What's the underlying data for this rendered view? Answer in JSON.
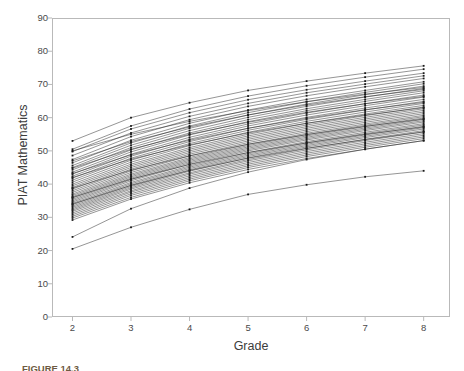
{
  "figure": {
    "caption": "FIGURE 14.3",
    "background_color": "#ffffff",
    "frame_color": "#b9b9b9",
    "line_color": "#1a1a1a",
    "text_color": "#3c3c3c"
  },
  "chart_data": {
    "type": "line",
    "title": "",
    "subtitle": "",
    "xlabel": "Grade",
    "ylabel": "PIAT Mathematics",
    "xlim": [
      1.65,
      8.45
    ],
    "ylim": [
      0,
      90
    ],
    "xticks": [
      2,
      3,
      4,
      5,
      6,
      7,
      8
    ],
    "xtick_labels": [
      "2",
      "3",
      "4",
      "5",
      "6",
      "7",
      "8"
    ],
    "yticks": [
      0,
      10,
      20,
      30,
      40,
      50,
      60,
      70,
      80,
      90
    ],
    "ytick_labels": [
      "0",
      "10",
      "20",
      "30",
      "40",
      "50",
      "60",
      "70",
      "80",
      "90"
    ],
    "grid": false,
    "legend": null,
    "legend_position": "none",
    "marker": "dot",
    "x": [
      2,
      3,
      4,
      5,
      6,
      7,
      8
    ],
    "series": [
      {
        "name": "case-01",
        "values": [
          53.0,
          60.0,
          64.5,
          68.2,
          71.0,
          73.4,
          75.6
        ]
      },
      {
        "name": "case-02",
        "values": [
          50.5,
          57.5,
          62.6,
          66.5,
          69.6,
          72.2,
          74.6
        ]
      },
      {
        "name": "case-03",
        "values": [
          49.8,
          56.6,
          61.5,
          65.4,
          68.4,
          71.0,
          73.4
        ]
      },
      {
        "name": "case-04",
        "values": [
          48.6,
          55.4,
          60.4,
          64.3,
          67.5,
          70.1,
          72.6
        ]
      },
      {
        "name": "case-05",
        "values": [
          47.4,
          54.3,
          59.4,
          63.4,
          66.6,
          69.3,
          71.8
        ]
      },
      {
        "name": "case-06",
        "values": [
          46.4,
          53.2,
          58.3,
          62.3,
          65.5,
          68.2,
          70.8
        ]
      },
      {
        "name": "case-07",
        "values": [
          45.6,
          52.4,
          57.5,
          61.5,
          64.8,
          67.6,
          70.2
        ]
      },
      {
        "name": "case-08",
        "values": [
          45.0,
          51.7,
          56.8,
          60.8,
          64.1,
          66.9,
          69.5
        ]
      },
      {
        "name": "case-09",
        "values": [
          44.3,
          51.0,
          56.1,
          60.1,
          63.4,
          66.2,
          68.8
        ]
      },
      {
        "name": "case-10",
        "values": [
          43.6,
          50.3,
          55.4,
          59.4,
          62.7,
          65.5,
          68.1
        ]
      },
      {
        "name": "case-11",
        "values": [
          43.0,
          49.7,
          54.8,
          58.8,
          62.1,
          64.9,
          67.5
        ]
      },
      {
        "name": "case-12",
        "values": [
          42.4,
          49.0,
          54.1,
          58.1,
          61.4,
          64.2,
          66.8
        ]
      },
      {
        "name": "case-13",
        "values": [
          41.8,
          48.4,
          53.5,
          57.5,
          60.8,
          63.6,
          66.2
        ]
      },
      {
        "name": "case-14",
        "values": [
          41.2,
          47.8,
          52.8,
          56.8,
          60.1,
          62.9,
          65.5
        ]
      },
      {
        "name": "case-15",
        "values": [
          40.6,
          47.2,
          52.2,
          56.2,
          59.5,
          62.3,
          64.9
        ]
      },
      {
        "name": "case-16",
        "values": [
          40.0,
          46.6,
          51.6,
          55.6,
          58.9,
          61.7,
          64.3
        ]
      },
      {
        "name": "case-17",
        "values": [
          39.5,
          46.0,
          51.0,
          55.0,
          58.3,
          61.1,
          63.7
        ]
      },
      {
        "name": "case-18",
        "values": [
          39.0,
          45.5,
          50.5,
          54.5,
          57.8,
          60.6,
          63.2
        ]
      },
      {
        "name": "case-19",
        "values": [
          38.5,
          45.0,
          50.0,
          54.0,
          57.3,
          60.1,
          62.7
        ]
      },
      {
        "name": "case-20",
        "values": [
          38.0,
          44.5,
          49.5,
          53.5,
          56.8,
          59.6,
          62.2
        ]
      },
      {
        "name": "case-21",
        "values": [
          37.5,
          44.0,
          49.0,
          53.0,
          56.3,
          59.1,
          61.7
        ]
      },
      {
        "name": "case-22",
        "values": [
          37.0,
          43.5,
          48.5,
          52.5,
          55.8,
          58.6,
          61.2
        ]
      },
      {
        "name": "case-23",
        "values": [
          36.6,
          43.0,
          48.0,
          52.0,
          55.3,
          58.1,
          60.7
        ]
      },
      {
        "name": "case-24",
        "values": [
          36.2,
          42.6,
          47.6,
          51.6,
          54.9,
          57.7,
          60.3
        ]
      },
      {
        "name": "case-25",
        "values": [
          35.8,
          42.2,
          47.2,
          51.2,
          54.5,
          57.3,
          59.9
        ]
      },
      {
        "name": "case-26",
        "values": [
          35.4,
          41.8,
          46.8,
          50.8,
          54.1,
          56.9,
          59.5
        ]
      },
      {
        "name": "case-27",
        "values": [
          35.0,
          41.4,
          46.4,
          50.4,
          53.7,
          56.5,
          59.1
        ]
      },
      {
        "name": "case-28",
        "values": [
          34.6,
          41.0,
          46.0,
          50.0,
          53.3,
          56.1,
          58.7
        ]
      },
      {
        "name": "case-29",
        "values": [
          34.2,
          40.5,
          45.5,
          49.5,
          52.8,
          55.6,
          58.2
        ]
      },
      {
        "name": "case-30",
        "values": [
          33.8,
          40.1,
          45.1,
          49.1,
          52.4,
          55.2,
          57.8
        ]
      },
      {
        "name": "case-31",
        "values": [
          33.4,
          39.7,
          44.7,
          48.7,
          52.0,
          54.8,
          57.4
        ]
      },
      {
        "name": "case-32",
        "values": [
          33.0,
          39.3,
          44.3,
          48.3,
          51.6,
          54.4,
          57.0
        ]
      },
      {
        "name": "case-33",
        "values": [
          32.6,
          38.9,
          43.9,
          47.9,
          51.2,
          54.0,
          56.6
        ]
      },
      {
        "name": "case-34",
        "values": [
          32.2,
          38.5,
          43.4,
          47.4,
          50.7,
          53.5,
          56.1
        ]
      },
      {
        "name": "case-35",
        "values": [
          31.8,
          38.0,
          43.0,
          47.0,
          50.3,
          53.1,
          55.7
        ]
      },
      {
        "name": "case-36",
        "values": [
          31.3,
          37.6,
          42.5,
          46.5,
          49.8,
          52.6,
          55.2
        ]
      },
      {
        "name": "case-37",
        "values": [
          30.8,
          37.1,
          42.0,
          46.0,
          49.3,
          52.1,
          54.7
        ]
      },
      {
        "name": "case-38",
        "values": [
          30.3,
          36.6,
          41.5,
          45.5,
          48.8,
          51.6,
          54.2
        ]
      },
      {
        "name": "case-39",
        "values": [
          29.8,
          36.0,
          41.0,
          45.0,
          48.3,
          51.1,
          53.7
        ]
      },
      {
        "name": "case-40",
        "values": [
          29.2,
          35.5,
          40.4,
          44.4,
          47.7,
          50.5,
          53.1
        ]
      },
      {
        "name": "case-41",
        "values": [
          42.0,
          47.5,
          51.8,
          55.4,
          58.3,
          60.8,
          63.0
        ]
      },
      {
        "name": "case-42",
        "values": [
          44.8,
          50.5,
          55.0,
          58.6,
          61.6,
          64.2,
          66.4
        ]
      },
      {
        "name": "case-43",
        "values": [
          47.0,
          52.8,
          57.2,
          60.8,
          63.8,
          66.3,
          68.5
        ]
      },
      {
        "name": "case-44",
        "values": [
          38.8,
          44.2,
          48.5,
          52.0,
          54.9,
          57.4,
          59.6
        ]
      },
      {
        "name": "case-45",
        "values": [
          36.0,
          41.5,
          45.9,
          49.5,
          52.4,
          55.0,
          57.2
        ]
      },
      {
        "name": "case-46",
        "values": [
          34.0,
          39.6,
          44.1,
          47.8,
          50.8,
          53.4,
          55.7
        ]
      },
      {
        "name": "case-47",
        "values": [
          50.0,
          55.0,
          58.9,
          62.1,
          64.8,
          67.1,
          69.1
        ]
      },
      {
        "name": "case-48",
        "values": [
          43.2,
          48.8,
          53.2,
          56.8,
          59.8,
          62.4,
          64.6
        ]
      },
      {
        "name": "case-49",
        "values": [
          24.1,
          32.6,
          38.8,
          43.6,
          47.4,
          50.5,
          53.1
        ]
      },
      {
        "name": "case-50",
        "values": [
          20.5,
          27.0,
          32.4,
          36.9,
          39.8,
          42.2,
          44.0
        ]
      }
    ]
  }
}
